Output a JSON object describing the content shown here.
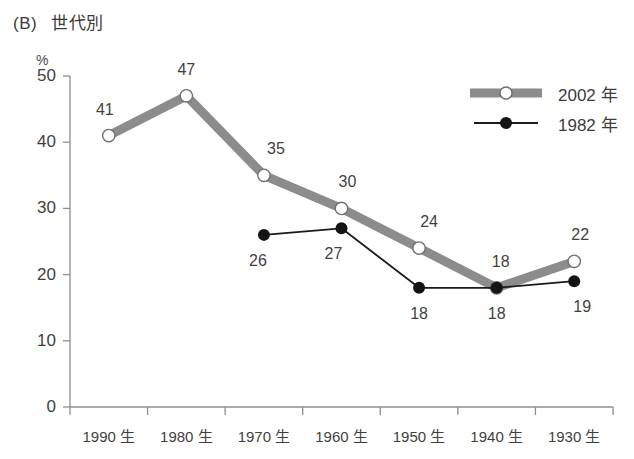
{
  "title": {
    "tag": "(B)",
    "text": "世代別"
  },
  "axis_unit": "%",
  "legend": [
    {
      "label": "2002 年",
      "marker": "open-circle-icon",
      "color": "#8c8c8c"
    },
    {
      "label": "1982 年",
      "marker": "filled-circle-icon",
      "color": "#1a1a1a"
    }
  ],
  "chart_data": {
    "type": "line",
    "xlabel": "",
    "ylabel": "%",
    "ylim": [
      0,
      50
    ],
    "yticks": [
      0,
      10,
      20,
      30,
      40,
      50
    ],
    "grid": false,
    "legend_position": "top-right",
    "categories": [
      "1990 生",
      "1980 生",
      "1970 生",
      "1960 生",
      "1950 生",
      "1940 生",
      "1930 生"
    ],
    "series": [
      {
        "name": "2002 年",
        "color": "#8c8c8c",
        "marker": "open-circle",
        "values": [
          41,
          47,
          35,
          30,
          24,
          18,
          22
        ],
        "labels": [
          "41",
          "47",
          "35",
          "30",
          "24",
          "18",
          "22"
        ]
      },
      {
        "name": "1982 年",
        "color": "#1a1a1a",
        "marker": "filled-circle",
        "values": [
          null,
          null,
          26,
          27,
          18,
          18,
          19
        ],
        "labels": [
          "",
          "",
          "26",
          "27",
          "18",
          "18",
          "19"
        ]
      }
    ]
  }
}
